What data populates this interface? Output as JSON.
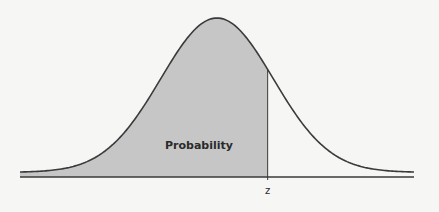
{
  "chart_data": {
    "type": "area",
    "title": "",
    "distribution": "normal",
    "mean": 0,
    "std": 1,
    "xlim": [
      -3.5,
      3.5
    ],
    "shaded_region": {
      "from": -3.5,
      "to": 0.9
    },
    "annotations": {
      "area_label": "Probability",
      "z_label": "z"
    },
    "xlabel": "",
    "ylabel": "",
    "grid": false,
    "colors": {
      "fill": "#c6c6c6",
      "curve": "#3a3a3a",
      "axis": "#3a3a3a",
      "background": "#f6f6f4"
    }
  }
}
